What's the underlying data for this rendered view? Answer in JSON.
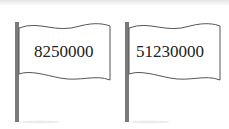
{
  "flags": [
    {
      "value": "8250000"
    },
    {
      "value": "51230000"
    }
  ],
  "colors": {
    "pole": "#777777",
    "flag_fill": "#ffffff",
    "flag_stroke": "#555555",
    "text": "#222222"
  }
}
